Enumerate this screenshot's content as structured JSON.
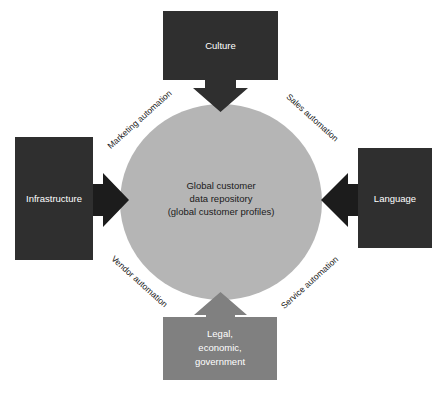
{
  "diagram": {
    "type": "hub-and-spoke",
    "title_present": false,
    "center": {
      "shape": "ellipse",
      "fill": "#b5b5b5",
      "text_color": "#1a1a1a",
      "lines": [
        "Global customer",
        "data repository",
        "(global customer profiles)"
      ]
    },
    "boxes": [
      {
        "id": "culture",
        "label": "Culture",
        "position": "top",
        "fill": "#2f2f2f",
        "text_color": "#ffffff",
        "arrow_direction": "down",
        "arrow_fill": "#2f2f2f"
      },
      {
        "id": "infrastructure",
        "label": "Infrastructure",
        "position": "left",
        "fill": "#2f2f2f",
        "text_color": "#ffffff",
        "arrow_direction": "right",
        "arrow_fill": "#1c1c1c"
      },
      {
        "id": "language",
        "label": "Language",
        "position": "right",
        "fill": "#2f2f2f",
        "text_color": "#ffffff",
        "arrow_direction": "left",
        "arrow_fill": "#1c1c1c"
      },
      {
        "id": "legal-economic-government",
        "label": "Legal, economic, government",
        "lines": [
          "Legal,",
          "economic,",
          "government"
        ],
        "position": "bottom",
        "fill": "#808080",
        "text_color": "#ffffff",
        "arrow_direction": "up",
        "arrow_fill": "#808080"
      }
    ],
    "flow_labels": [
      {
        "id": "marketing-automation",
        "text": "Marketing automation",
        "corner": "top-left",
        "rotation_deg": -42
      },
      {
        "id": "sales-automation",
        "text": "Sales automation",
        "corner": "top-right",
        "rotation_deg": 42
      },
      {
        "id": "vendor-automation",
        "text": "Vendor automation",
        "corner": "bottom-left",
        "rotation_deg": 42
      },
      {
        "id": "service-automation",
        "text": "Service automation",
        "corner": "bottom-right",
        "rotation_deg": -42
      }
    ]
  }
}
